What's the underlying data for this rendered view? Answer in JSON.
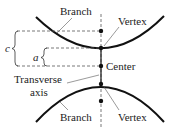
{
  "diagram": {
    "labels": {
      "branch_top": "Branch",
      "branch_bottom": "Branch",
      "vertex_top": "Vertex",
      "vertex_bottom": "Vertex",
      "center": "Center",
      "transverse_line1": "Transverse",
      "transverse_line2": "axis",
      "c": "c",
      "a": "a"
    },
    "colors": {
      "stroke": "#111111",
      "dashed": "#555555",
      "text": "#222222"
    }
  }
}
